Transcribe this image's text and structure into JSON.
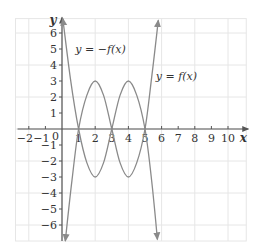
{
  "chart_data": {
    "type": "line",
    "title": "",
    "xlabel": "x",
    "ylabel": "y",
    "xlim": [
      -2.8,
      11.1
    ],
    "ylim": [
      -7,
      6.9
    ],
    "grid": true,
    "grid_spacing": 2,
    "x_ticks": [
      -2,
      -1,
      1,
      2,
      3,
      4,
      5,
      6,
      7,
      8,
      9,
      10
    ],
    "y_ticks": [
      -6,
      -5,
      -4,
      -3,
      -2,
      -1,
      1,
      2,
      3,
      4,
      5,
      6
    ],
    "origin_label": "0",
    "series": [
      {
        "name": "y = f(x)",
        "label": "y = f(x)",
        "label_pos": [
          5.65,
          3.05
        ],
        "points": [
          [
            0.2,
            -7
          ],
          [
            0.6,
            -3.2
          ],
          [
            1,
            0
          ],
          [
            1.5,
            2.12
          ],
          [
            2,
            3
          ],
          [
            2.5,
            2.12
          ],
          [
            3,
            0
          ],
          [
            3.5,
            -2.12
          ],
          [
            4,
            -3
          ],
          [
            4.5,
            -2.12
          ],
          [
            5,
            0
          ],
          [
            5.4,
            3.2
          ],
          [
            5.8,
            6.8
          ]
        ],
        "arrows": "both"
      },
      {
        "name": "y = -f(x)",
        "label": "y = −f(x)",
        "label_pos": [
          0.8,
          4.75
        ],
        "points": [
          [
            0.05,
            6.9
          ],
          [
            0.5,
            3.2
          ],
          [
            1,
            0
          ],
          [
            1.5,
            -2.12
          ],
          [
            2,
            -3
          ],
          [
            2.5,
            -2.12
          ],
          [
            3,
            0
          ],
          [
            3.5,
            2.12
          ],
          [
            4,
            3
          ],
          [
            4.5,
            2.12
          ],
          [
            5,
            0
          ],
          [
            5.4,
            -3.2
          ],
          [
            5.75,
            -6.9
          ]
        ],
        "arrows": "both"
      }
    ],
    "colors": {
      "grid": "#e6e6e6",
      "axis": "#555555",
      "curve": "#8a8a8a",
      "text": "#333333"
    }
  }
}
